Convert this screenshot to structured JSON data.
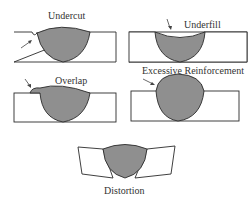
{
  "diagram": {
    "colors": {
      "weld_fill": "#8f8f8f",
      "outline": "#2a2a2a",
      "plate_fill": "#ffffff",
      "text": "#333333"
    },
    "panels": [
      {
        "id": "undercut",
        "label": "Undercut"
      },
      {
        "id": "underfill",
        "label": "Underfill"
      },
      {
        "id": "overlap",
        "label": "Overlap"
      },
      {
        "id": "excessive-reinforcement",
        "label": "Excessive Reinforcement"
      },
      {
        "id": "distortion",
        "label": "Distortion"
      }
    ]
  }
}
